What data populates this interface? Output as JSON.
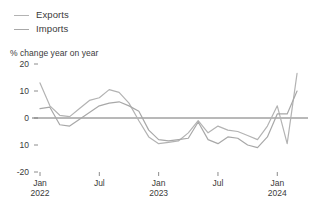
{
  "legend": {
    "items": [
      {
        "label": "Exports",
        "key": "exports",
        "color": "#b3b3b3"
      },
      {
        "label": "Imports",
        "key": "imports",
        "color": "#a8a8a8"
      }
    ]
  },
  "subtitle": "% change year on year",
  "chart_data": {
    "type": "line",
    "title": "",
    "subtitle": "% change year on year",
    "xlabel": "",
    "ylabel": "",
    "ylim": [
      -20,
      20
    ],
    "yticks": [
      20,
      10,
      0,
      -10,
      -20
    ],
    "ytick_labels": [
      "20",
      "10",
      "0",
      "10",
      "-20"
    ],
    "grid": false,
    "zero_line": true,
    "legend_position": "top-left",
    "x": [
      "Jan 2022",
      "Feb 2022",
      "Mar 2022",
      "Apr 2022",
      "May 2022",
      "Jun 2022",
      "Jul 2022",
      "Aug 2022",
      "Sep 2022",
      "Oct 2022",
      "Nov 2022",
      "Dec 2022",
      "Jan 2023",
      "Feb 2023",
      "Mar 2023",
      "Apr 2023",
      "May 2023",
      "Jun 2023",
      "Jul 2023",
      "Aug 2023",
      "Sep 2023",
      "Oct 2023",
      "Nov 2023",
      "Dec 2023",
      "Jan 2024",
      "Feb 2024"
    ],
    "xticks": [
      "Jan 2022",
      "Jul 2022",
      "Jan 2023",
      "Jul 2023",
      "Jan 2024"
    ],
    "xtick_labels": [
      {
        "line1": "Jan",
        "line2": "2022"
      },
      {
        "line1": "Jul",
        "line2": ""
      },
      {
        "line1": "Jan",
        "line2": "2023"
      },
      {
        "line1": "Jul",
        "line2": ""
      },
      {
        "line1": "Jan",
        "line2": "2024"
      }
    ],
    "series": [
      {
        "name": "Exports",
        "color": "#b3b3b3",
        "values": [
          13.0,
          4.5,
          1.0,
          0.5,
          3.5,
          6.5,
          7.5,
          10.5,
          9.5,
          5.5,
          -1.0,
          -7.0,
          -9.5,
          -9.0,
          -8.5,
          -5.5,
          -1.0,
          -5.5,
          -3.0,
          -4.5,
          -5.0,
          -6.5,
          -8.0,
          -3.0,
          4.5,
          -9.5
        ]
      },
      {
        "name": "Imports",
        "color": "#a8a8a8",
        "values": [
          3.5,
          4.0,
          -2.5,
          -3.0,
          -0.5,
          2.0,
          4.5,
          5.5,
          6.0,
          4.5,
          2.5,
          -4.5,
          -8.0,
          -8.5,
          -8.0,
          -7.5,
          -1.5,
          -8.0,
          -9.5,
          -7.0,
          -7.5,
          -10.0,
          -11.0,
          -7.0,
          1.5,
          1.5
        ]
      },
      {
        "name": "Exports tail",
        "color": "#b3b3b3",
        "values_tail": [
          16.5
        ]
      },
      {
        "name": "Imports tail",
        "color": "#a8a8a8",
        "values_tail": [
          10.0
        ]
      }
    ]
  }
}
